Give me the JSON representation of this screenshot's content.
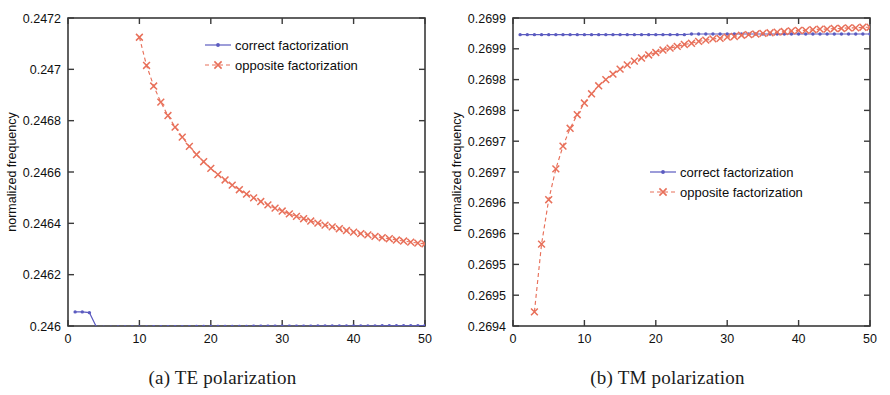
{
  "figure": {
    "background": "#ffffff",
    "series_colors": {
      "correct": "#5b5bc0",
      "opposite": "#e8705a"
    }
  },
  "panels": [
    {
      "id": "te",
      "caption_index": "(a)",
      "caption_text": "TE polarization",
      "caption_full": "(a)  TE polarization",
      "legend_position": "top-right",
      "chart_data": {
        "type": "line",
        "title": "",
        "xlabel": "N",
        "ylabel": "normalized frequency",
        "xlim": [
          0,
          50
        ],
        "ylim": [
          0.246,
          0.2472
        ],
        "xticks": [
          0,
          10,
          20,
          30,
          40,
          50
        ],
        "xtick_labels": [
          "0",
          "10",
          "20",
          "30",
          "40",
          "50"
        ],
        "yticks": [
          0.246,
          0.2462,
          0.2464,
          0.2466,
          0.2468,
          0.247,
          0.2472
        ],
        "ytick_labels": [
          "0.246",
          "0.2462",
          "0.2464",
          "0.2466",
          "0.2468",
          "0.247",
          "0.2472"
        ],
        "grid": false,
        "series": [
          {
            "name": "correct factorization",
            "marker": "dot",
            "linestyle": "solid",
            "color": "#5b5bc0",
            "x": [
              1,
              2,
              3,
              4,
              5,
              6,
              7,
              8,
              9,
              10,
              11,
              12,
              13,
              14,
              15,
              16,
              17,
              18,
              19,
              20,
              21,
              22,
              23,
              24,
              25,
              26,
              27,
              28,
              29,
              30,
              31,
              32,
              33,
              34,
              35,
              36,
              37,
              38,
              39,
              40,
              41,
              42,
              43,
              44,
              45,
              46,
              47,
              48,
              49,
              50
            ],
            "y": [
              0.246055,
              0.246055,
              0.246052,
              0.245995,
              0.245995,
              0.245995,
              0.245996,
              0.245996,
              0.245996,
              0.245996,
              0.245996,
              0.245997,
              0.245997,
              0.245997,
              0.245997,
              0.245997,
              0.245997,
              0.245998,
              0.245998,
              0.245998,
              0.245998,
              0.245998,
              0.245998,
              0.245998,
              0.245998,
              0.245999,
              0.245999,
              0.245999,
              0.245999,
              0.245999,
              0.245999,
              0.245999,
              0.245999,
              0.245999,
              0.246,
              0.246,
              0.246,
              0.246,
              0.246,
              0.246,
              0.246,
              0.246,
              0.246,
              0.246001,
              0.246001,
              0.246001,
              0.246001,
              0.246001,
              0.246001,
              0.246002
            ]
          },
          {
            "name": "opposite factorization",
            "marker": "x",
            "linestyle": "dashed",
            "color": "#e8705a",
            "x": [
              10,
              11,
              12,
              13,
              14,
              15,
              16,
              17,
              18,
              19,
              20,
              21,
              22,
              23,
              24,
              25,
              26,
              27,
              28,
              29,
              30,
              31,
              32,
              33,
              34,
              35,
              36,
              37,
              38,
              39,
              40,
              41,
              42,
              43,
              44,
              45,
              46,
              47,
              48,
              49,
              50
            ],
            "y": [
              0.247125,
              0.247015,
              0.246935,
              0.246872,
              0.24682,
              0.246775,
              0.246736,
              0.2467,
              0.246668,
              0.24664,
              0.246614,
              0.24659,
              0.246569,
              0.246549,
              0.246531,
              0.246514,
              0.246499,
              0.246485,
              0.246472,
              0.246459,
              0.246448,
              0.246437,
              0.246427,
              0.246418,
              0.246409,
              0.246401,
              0.246393,
              0.246386,
              0.246379,
              0.246372,
              0.246366,
              0.24636,
              0.246355,
              0.246349,
              0.246344,
              0.24634,
              0.246335,
              0.246331,
              0.246327,
              0.246323,
              0.24632
            ]
          }
        ]
      }
    },
    {
      "id": "tm",
      "caption_index": "(b)",
      "caption_text": "TM polarization",
      "caption_full": "(b)  TM polarization",
      "legend_position": "center-right",
      "chart_data": {
        "type": "line",
        "title": "",
        "xlabel": "N",
        "ylabel": "normalized frequency",
        "xlim": [
          0,
          50
        ],
        "ylim": [
          0.2694,
          0.2699
        ],
        "xticks": [
          0,
          10,
          20,
          30,
          40,
          50
        ],
        "xtick_labels": [
          "0",
          "10",
          "20",
          "30",
          "40",
          "50"
        ],
        "yticks": [
          0.2694,
          0.26945,
          0.2695,
          0.26955,
          0.2696,
          0.26965,
          0.2697,
          0.26975,
          0.2698,
          0.26985,
          0.2699
        ],
        "ytick_labels": [
          "0.2694",
          "0.2695",
          "0.2695",
          "0.2696",
          "0.2696",
          "0.2697",
          "0.2697",
          "0.2698",
          "0.2698",
          "0.2699",
          "0.2699"
        ],
        "grid": false,
        "series": [
          {
            "name": "correct factorization",
            "marker": "dot",
            "linestyle": "solid",
            "color": "#5b5bc0",
            "x": [
              1,
              2,
              3,
              4,
              5,
              6,
              7,
              8,
              9,
              10,
              11,
              12,
              13,
              14,
              15,
              16,
              17,
              18,
              19,
              20,
              21,
              22,
              23,
              24,
              25,
              26,
              27,
              28,
              29,
              30,
              31,
              32,
              33,
              34,
              35,
              36,
              37,
              38,
              39,
              40,
              41,
              42,
              43,
              44,
              45,
              46,
              47,
              48,
              49,
              50
            ],
            "y": [
              0.269873,
              0.269873,
              0.269873,
              0.269873,
              0.269873,
              0.269873,
              0.269873,
              0.269873,
              0.269873,
              0.269873,
              0.269873,
              0.269873,
              0.269873,
              0.269873,
              0.269873,
              0.269873,
              0.269873,
              0.269873,
              0.269873,
              0.269873,
              0.269873,
              0.269873,
              0.269873,
              0.269873,
              0.269874,
              0.269874,
              0.269874,
              0.269874,
              0.269874,
              0.269874,
              0.269874,
              0.269874,
              0.269874,
              0.269874,
              0.269874,
              0.269874,
              0.269874,
              0.269874,
              0.269874,
              0.269874,
              0.269874,
              0.269874,
              0.269874,
              0.269874,
              0.269874,
              0.269874,
              0.269874,
              0.269874,
              0.269874,
              0.269874
            ]
          },
          {
            "name": "opposite factorization",
            "marker": "x",
            "linestyle": "dashed",
            "color": "#e8705a",
            "x": [
              3,
              4,
              5,
              6,
              7,
              8,
              9,
              10,
              11,
              12,
              13,
              14,
              15,
              16,
              17,
              18,
              19,
              20,
              21,
              22,
              23,
              24,
              25,
              26,
              27,
              28,
              29,
              30,
              31,
              32,
              33,
              34,
              35,
              36,
              37,
              38,
              39,
              40,
              41,
              42,
              43,
              44,
              45,
              46,
              47,
              48,
              49,
              50
            ],
            "y": [
              0.269423,
              0.269533,
              0.269605,
              0.269655,
              0.269692,
              0.269721,
              0.269743,
              0.269762,
              0.269777,
              0.26979,
              0.2698,
              0.269809,
              0.269817,
              0.269824,
              0.26983,
              0.269835,
              0.26984,
              0.269844,
              0.269848,
              0.269851,
              0.269854,
              0.269857,
              0.269859,
              0.269862,
              0.269864,
              0.269866,
              0.269867,
              0.269869,
              0.26987,
              0.269872,
              0.269873,
              0.269874,
              0.269875,
              0.269876,
              0.269877,
              0.269878,
              0.269879,
              0.26988,
              0.26988,
              0.269881,
              0.269882,
              0.269882,
              0.269883,
              0.269883,
              0.269884,
              0.269884,
              0.269885,
              0.269885
            ]
          }
        ]
      }
    }
  ]
}
